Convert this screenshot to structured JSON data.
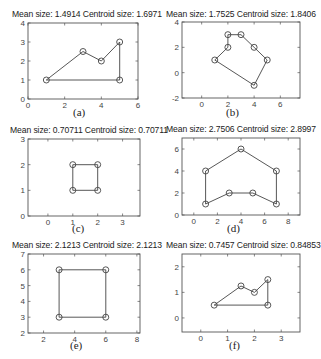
{
  "chart_data": [
    {
      "type": "line",
      "label": "(a)",
      "title": "Mean size: 1.4914 Centroid size: 1.6971",
      "xlim": [
        0,
        6
      ],
      "ylim": [
        0,
        4
      ],
      "xticks": [
        0,
        2,
        4,
        6
      ],
      "yticks": [
        0,
        1,
        2,
        3,
        4
      ],
      "points": [
        [
          1,
          1
        ],
        [
          3,
          2.5
        ],
        [
          4,
          2
        ],
        [
          5,
          3
        ],
        [
          5,
          1
        ],
        [
          1,
          1
        ]
      ],
      "markers": [
        [
          1,
          1
        ],
        [
          3,
          2.5
        ],
        [
          4,
          2
        ],
        [
          5,
          3
        ],
        [
          5,
          1
        ]
      ]
    },
    {
      "type": "line",
      "label": "(b)",
      "title": "Mean size: 1.7525 Centroid size: 1.8406",
      "xlim": [
        -1.5,
        7.5
      ],
      "ylim": [
        -2,
        4
      ],
      "xticks": [
        0,
        2,
        4,
        6
      ],
      "yticks": [
        -2,
        0,
        2,
        4
      ],
      "points": [
        [
          1,
          1
        ],
        [
          2,
          2
        ],
        [
          2,
          3
        ],
        [
          3,
          3
        ],
        [
          4,
          2
        ],
        [
          5,
          1
        ],
        [
          4,
          -1
        ],
        [
          1,
          1
        ]
      ],
      "markers": [
        [
          1,
          1
        ],
        [
          2,
          2
        ],
        [
          2,
          3
        ],
        [
          3,
          3
        ],
        [
          4,
          2
        ],
        [
          5,
          1
        ],
        [
          4,
          -1
        ]
      ]
    },
    {
      "type": "line",
      "label": "(c)",
      "title": "Mean size: 0.70711 Centroid size: 0.70711",
      "xlim": [
        -0.8,
        3.7
      ],
      "ylim": [
        0,
        3
      ],
      "xticks": [
        0,
        1,
        2,
        3
      ],
      "yticks": [
        0,
        1,
        2,
        3
      ],
      "points": [
        [
          1,
          1
        ],
        [
          1,
          2
        ],
        [
          2,
          2
        ],
        [
          2,
          1
        ],
        [
          1,
          1
        ]
      ],
      "markers": [
        [
          1,
          1
        ],
        [
          1,
          2
        ],
        [
          2,
          2
        ],
        [
          2,
          1
        ]
      ]
    },
    {
      "type": "line",
      "label": "(d)",
      "title": "Mean size: 2.7506 Centroid size: 2.8997",
      "xlim": [
        -1,
        9
      ],
      "ylim": [
        0,
        7
      ],
      "xticks": [
        0,
        2,
        4,
        6,
        8
      ],
      "yticks": [
        0,
        2,
        4,
        6
      ],
      "points": [
        [
          1,
          1
        ],
        [
          1,
          4
        ],
        [
          4,
          6
        ],
        [
          7,
          4
        ],
        [
          7,
          1
        ],
        [
          5,
          2
        ],
        [
          3,
          2
        ],
        [
          1,
          1
        ]
      ],
      "markers": [
        [
          1,
          1
        ],
        [
          1,
          4
        ],
        [
          4,
          6
        ],
        [
          7,
          4
        ],
        [
          7,
          1
        ],
        [
          5,
          2
        ],
        [
          3,
          2
        ]
      ]
    },
    {
      "type": "line",
      "label": "(e)",
      "title": "Mean size: 2.1213 Centroid size: 2.1213",
      "xlim": [
        1,
        8.2
      ],
      "ylim": [
        2,
        7
      ],
      "xticks": [
        2,
        4,
        6,
        8
      ],
      "yticks": [
        2,
        3,
        4,
        5,
        6,
        7
      ],
      "points": [
        [
          3,
          3
        ],
        [
          3,
          6
        ],
        [
          6,
          6
        ],
        [
          6,
          3
        ],
        [
          3,
          3
        ]
      ],
      "markers": [
        [
          3,
          3
        ],
        [
          3,
          6
        ],
        [
          6,
          6
        ],
        [
          6,
          3
        ]
      ]
    },
    {
      "type": "line",
      "label": "(f)",
      "title": "Mean size: 0.7457 Centroid size: 0.84853",
      "xlim": [
        -0.7,
        3.7
      ],
      "ylim": [
        -0.55,
        2.5
      ],
      "xticks": [
        0,
        1,
        2,
        3
      ],
      "yticks": [
        0,
        1,
        2
      ],
      "points": [
        [
          0.5,
          0.5
        ],
        [
          1.5,
          1.25
        ],
        [
          2,
          1
        ],
        [
          2.5,
          1.5
        ],
        [
          2.5,
          0.5
        ],
        [
          0.5,
          0.5
        ]
      ],
      "markers": [
        [
          0.5,
          0.5
        ],
        [
          1.5,
          1.25
        ],
        [
          2,
          1
        ],
        [
          2.5,
          1.5
        ],
        [
          2.5,
          0.5
        ]
      ]
    }
  ],
  "panels": [
    {
      "title": "Mean size: 1.4914 Centroid size: 1.6971",
      "label": "(a)"
    },
    {
      "title": "Mean size: 1.7525 Centroid size: 1.8406",
      "label": "(b)"
    },
    {
      "title": "Mean size: 0.70711 Centroid size: 0.70711",
      "label": "(c)"
    },
    {
      "title": "Mean size: 2.7506 Centroid size: 2.8997",
      "label": "(d)"
    },
    {
      "title": "Mean size: 2.1213 Centroid size: 2.1213",
      "label": "(e)"
    },
    {
      "title": "Mean size: 0.7457 Centroid size: 0.84853",
      "label": "(f)"
    }
  ]
}
